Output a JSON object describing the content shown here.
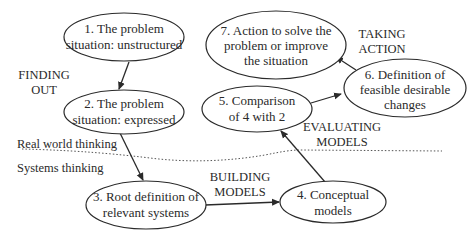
{
  "diagram": {
    "nodes": [
      {
        "id": "1",
        "lines": [
          "1. The problem",
          "situation: unstructured"
        ]
      },
      {
        "id": "2",
        "lines": [
          "2. The problem",
          "situation: expressed"
        ]
      },
      {
        "id": "3",
        "lines": [
          "3. Root definition of",
          "relevant systems"
        ]
      },
      {
        "id": "4",
        "lines": [
          "4. Conceptual",
          "models"
        ]
      },
      {
        "id": "5",
        "lines": [
          "5. Comparison",
          "of 4 with 2"
        ]
      },
      {
        "id": "6",
        "lines": [
          "6. Definition of",
          "feasible desirable",
          "changes"
        ]
      },
      {
        "id": "7",
        "lines": [
          "7. Action to solve the",
          "problem or improve",
          "the situation"
        ]
      }
    ],
    "phases": {
      "finding_out": [
        "FINDING",
        "OUT"
      ],
      "building_models": [
        "BUILDING",
        "MODELS"
      ],
      "evaluating_models": [
        "EVALUATING",
        "MODELS"
      ],
      "taking_action": [
        "TAKING",
        "ACTION"
      ]
    },
    "regions": {
      "real_world": "Real world thinking",
      "systems": "Systems thinking"
    },
    "edges": [
      {
        "from": "1",
        "to": "2"
      },
      {
        "from": "2",
        "to": "3"
      },
      {
        "from": "3",
        "to": "4"
      },
      {
        "from": "4",
        "to": "5"
      },
      {
        "from": "5",
        "to": "6"
      },
      {
        "from": "6",
        "to": "7"
      }
    ]
  }
}
